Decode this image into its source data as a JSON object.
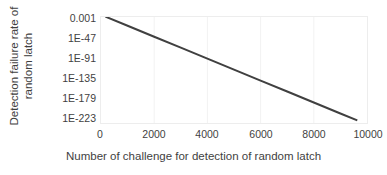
{
  "chart_data": {
    "type": "line",
    "title": "",
    "subtitle": "",
    "xlabel": "Number of challenge for detection of random latch",
    "ylabel": "Detection failure rate of random latch",
    "ylabel_lines": [
      "Detection failure rate of",
      "random latch"
    ],
    "x_tick_labels": [
      "0",
      "2000",
      "4000",
      "6000",
      "8000",
      "10000"
    ],
    "x_tick_values": [
      0,
      2000,
      4000,
      6000,
      8000,
      10000
    ],
    "y_tick_labels": [
      "0.001",
      "1E-47",
      "1E-91",
      "1E-135",
      "1E-179",
      "1E-223"
    ],
    "y_tick_exponents": [
      -3,
      -47,
      -91,
      -135,
      -179,
      -223
    ],
    "xlim": [
      0,
      10000
    ],
    "ylim_exponents": [
      -223,
      -3
    ],
    "yscale": "log",
    "grid": "vertical-only-faint",
    "legend": "none",
    "series": [
      {
        "name": "detection failure rate",
        "x": [
          200,
          1000,
          2000,
          3000,
          4000,
          5000,
          6000,
          7000,
          8000,
          9000,
          9600
        ],
        "y_exponents": [
          -3,
          -21.2,
          -44.0,
          -66.7,
          -89.5,
          -112.2,
          -135.0,
          -157.7,
          -180.5,
          -203.2,
          -216.8
        ],
        "color": "#404040",
        "width": 2
      }
    ],
    "colors": {
      "line": "#404040",
      "text": "#3f3f3f",
      "plot_border": "#ededed",
      "gridline": "#f2f2f2",
      "background": "#ffffff"
    }
  }
}
